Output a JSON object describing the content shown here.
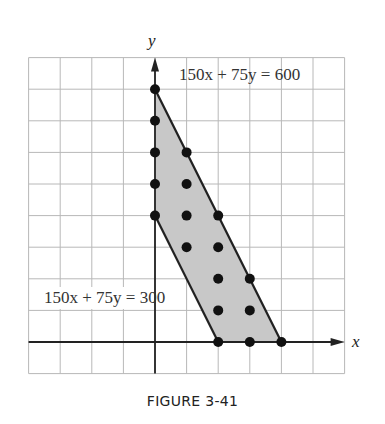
{
  "figure": {
    "caption": "FIGURE 3-41",
    "axis_labels": {
      "x": "x",
      "y": "y"
    },
    "equations": {
      "upper": "150x + 75y = 600",
      "lower": "150x + 75y = 300"
    }
  },
  "chart_data": {
    "type": "scatter",
    "title": "",
    "xlabel": "x",
    "ylabel": "y",
    "xlim": [
      -4,
      6
    ],
    "ylim": [
      -1,
      9
    ],
    "grid": true,
    "legend": "none",
    "region": {
      "description": "shaded feasible region between 150x + 75y = 300 and 150x + 75y = 600 with x >= 0, y >= 0",
      "vertices": [
        [
          0,
          4
        ],
        [
          0,
          8
        ],
        [
          4,
          0
        ],
        [
          2,
          0
        ]
      ],
      "fill": "#c8c8c8"
    },
    "lines": [
      {
        "label": "150x + 75y = 600",
        "from": [
          0,
          8
        ],
        "to": [
          4,
          0
        ]
      },
      {
        "label": "150x + 75y = 300",
        "from": [
          0,
          4
        ],
        "to": [
          2,
          0
        ]
      }
    ],
    "points": [
      [
        0,
        8
      ],
      [
        0,
        7
      ],
      [
        0,
        6
      ],
      [
        0,
        5
      ],
      [
        0,
        4
      ],
      [
        1,
        6
      ],
      [
        1,
        5
      ],
      [
        1,
        4
      ],
      [
        1,
        3
      ],
      [
        2,
        4
      ],
      [
        2,
        3
      ],
      [
        2,
        2
      ],
      [
        2,
        1
      ],
      [
        2,
        0
      ],
      [
        3,
        2
      ],
      [
        3,
        1
      ],
      [
        3,
        0
      ],
      [
        4,
        0
      ]
    ],
    "annotations": [
      {
        "text": "150x + 75y = 600",
        "near": [
          1,
          7.5
        ]
      },
      {
        "text": "150x + 75y = 300",
        "near": [
          -3.5,
          1.5
        ]
      }
    ]
  },
  "colors": {
    "grid": "#b8b8b8",
    "axis": "#222222",
    "region": "#c8c8c8",
    "points": "#111111",
    "text": "#333333"
  }
}
